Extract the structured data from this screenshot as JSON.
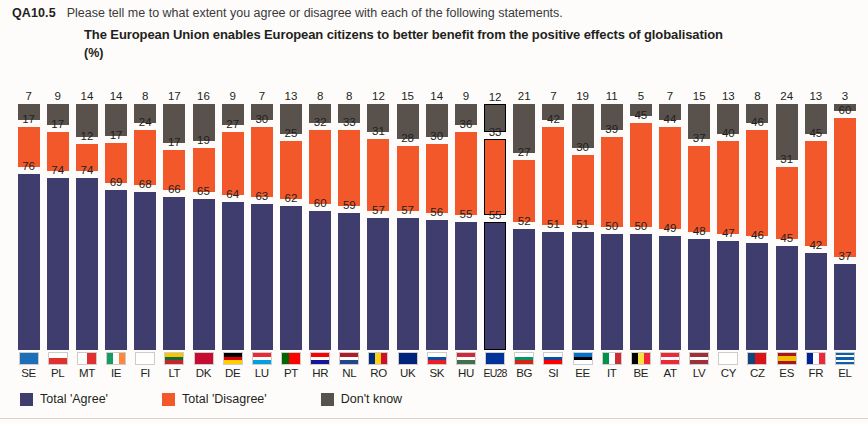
{
  "header": {
    "question_code": "QA10.5",
    "question_text": "Please tell me to what extent you agree or disagree with each of the following statements.",
    "statement": "The European Union enables European citizens to better benefit from the positive effects of globalisation",
    "unit": "(%)"
  },
  "legend": {
    "items": [
      {
        "label": "Total 'Agree'",
        "color": "#3f3c6e",
        "key": "agree"
      },
      {
        "label": "Total 'Disagree'",
        "color": "#f2582a",
        "key": "disagree"
      },
      {
        "label": "Don't know",
        "color": "#59514c",
        "key": "dont_know"
      }
    ]
  },
  "highlight_country": "EU28",
  "chart_data": {
    "type": "bar",
    "title": "The European Union enables European citizens to better benefit from the positive effects of globalisation",
    "subtitle": "QA10.5 Please tell me to what extent you agree or disagree with each of the following statements.",
    "xlabel": "",
    "ylabel": "(%)",
    "ylim": [
      0,
      100
    ],
    "grid": false,
    "legend_position": "bottom-left",
    "stacked": true,
    "categories": [
      "SE",
      "PL",
      "MT",
      "IE",
      "FI",
      "LT",
      "DK",
      "DE",
      "LU",
      "PT",
      "HR",
      "NL",
      "RO",
      "UK",
      "SK",
      "HU",
      "EU28",
      "BG",
      "SI",
      "EE",
      "IT",
      "BE",
      "AT",
      "LV",
      "CY",
      "CZ",
      "ES",
      "FR",
      "EL"
    ],
    "series": [
      {
        "name": "Don't know",
        "color": "#59514c",
        "values": [
          7,
          9,
          14,
          14,
          8,
          17,
          16,
          9,
          7,
          13,
          8,
          8,
          12,
          15,
          14,
          9,
          12,
          21,
          7,
          19,
          11,
          5,
          7,
          15,
          13,
          8,
          24,
          13,
          3
        ]
      },
      {
        "name": "Total 'Disagree'",
        "color": "#f2582a",
        "values": [
          17,
          17,
          12,
          17,
          24,
          17,
          19,
          27,
          30,
          25,
          32,
          33,
          31,
          28,
          30,
          36,
          33,
          27,
          42,
          30,
          39,
          45,
          44,
          37,
          40,
          46,
          31,
          45,
          60
        ]
      },
      {
        "name": "Total 'Agree'",
        "color": "#3f3c6e",
        "values": [
          76,
          74,
          74,
          69,
          68,
          66,
          65,
          64,
          63,
          62,
          60,
          59,
          57,
          57,
          56,
          55,
          55,
          52,
          51,
          51,
          50,
          50,
          49,
          48,
          47,
          46,
          45,
          42,
          37
        ]
      }
    ]
  }
}
